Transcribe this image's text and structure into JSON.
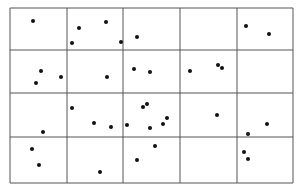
{
  "grid": {
    "columns": 5,
    "rows": 4,
    "line_color": "#555555",
    "x_lines": [
      10,
      67,
      123,
      180,
      237,
      293
    ],
    "y_lines": [
      8,
      50,
      93,
      137,
      183
    ]
  },
  "points": [
    [
      33,
      21
    ],
    [
      79,
      28
    ],
    [
      106,
      22
    ],
    [
      72,
      43
    ],
    [
      121,
      42
    ],
    [
      137,
      37
    ],
    [
      246,
      26
    ],
    [
      269,
      34
    ],
    [
      41,
      71
    ],
    [
      36,
      83
    ],
    [
      61,
      77
    ],
    [
      107,
      77
    ],
    [
      134,
      69
    ],
    [
      150,
      72
    ],
    [
      190,
      71
    ],
    [
      218,
      65
    ],
    [
      222,
      68
    ],
    [
      72,
      108
    ],
    [
      94,
      123
    ],
    [
      111,
      127
    ],
    [
      127,
      125
    ],
    [
      143,
      107
    ],
    [
      147,
      104
    ],
    [
      150,
      128
    ],
    [
      163,
      124
    ],
    [
      167,
      118
    ],
    [
      217,
      115
    ],
    [
      267,
      124
    ],
    [
      248,
      134
    ],
    [
      43,
      132
    ],
    [
      32,
      149
    ],
    [
      39,
      165
    ],
    [
      100,
      172
    ],
    [
      137,
      160
    ],
    [
      155,
      146
    ],
    [
      244,
      152
    ],
    [
      248,
      159
    ]
  ]
}
